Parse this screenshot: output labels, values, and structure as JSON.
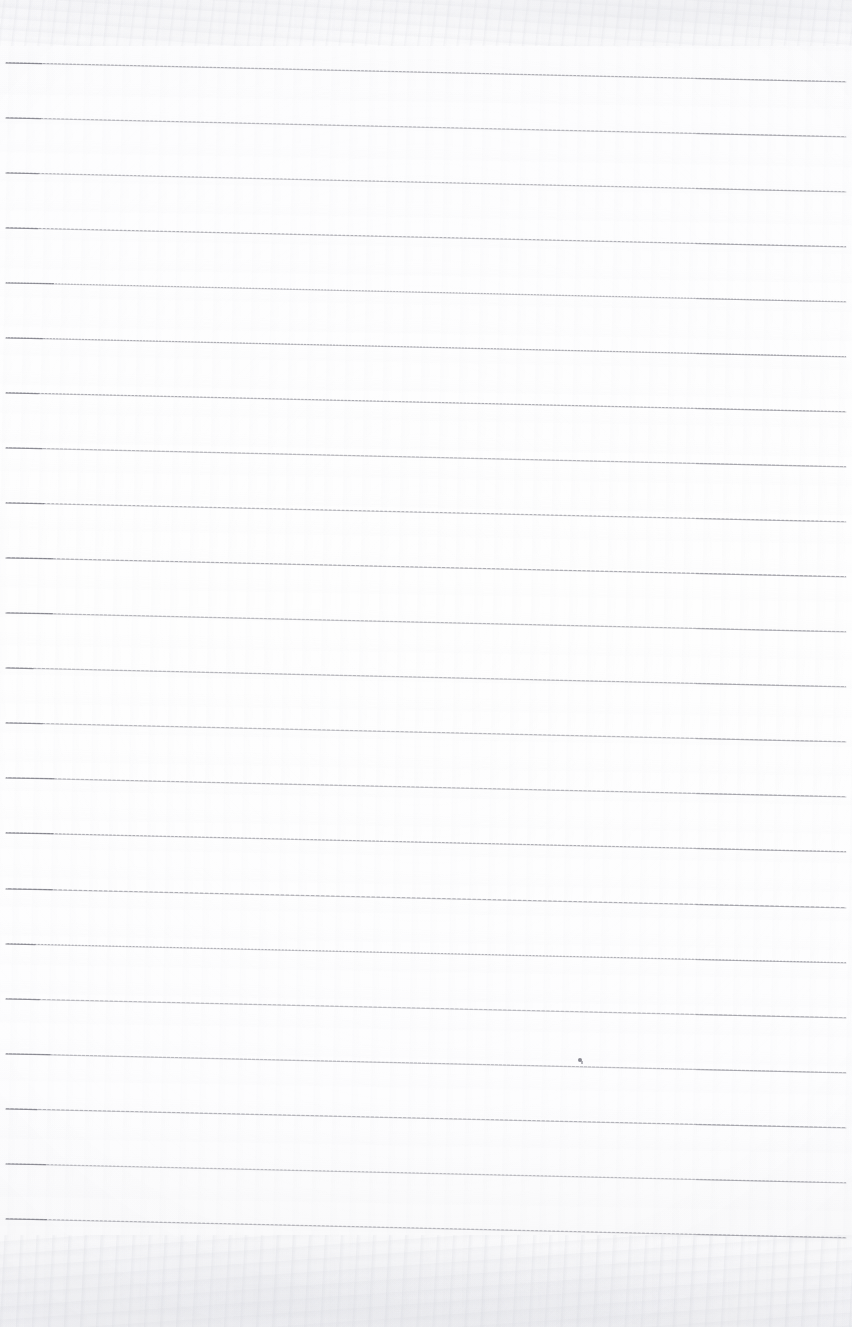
{
  "document": {
    "kind": "scanned-lined-notebook-page",
    "orientation": "portrait",
    "width_px": 852,
    "height_px": 1327,
    "page_background_color": "#fdfdfe",
    "rule_color": "#8a8a93",
    "content_text": "",
    "handwriting_present": "no",
    "printed_text_present": "no"
  },
  "paper": {
    "tone_top": "#f7f7f9",
    "tone_middle": "#fefefe",
    "tone_bottom": "#f3f3f5",
    "grain_top_band_height": 46,
    "grain_bottom_band_height": 92,
    "vignette_edge_color": "#dedee6"
  },
  "ruling": {
    "count": 22,
    "line_color": "#8a8a93",
    "line_thickness_px": 1,
    "spacing_px": 55,
    "first_line_y_left": 63,
    "left_margin_x": 6,
    "right_end_x": 846,
    "skew_drop_px": 19,
    "lines": [
      {
        "index": 1,
        "y_left": 63,
        "y_right": 82
      },
      {
        "index": 2,
        "y_left": 118,
        "y_right": 137
      },
      {
        "index": 3,
        "y_left": 173,
        "y_right": 192
      },
      {
        "index": 4,
        "y_left": 228,
        "y_right": 247
      },
      {
        "index": 5,
        "y_left": 283,
        "y_right": 302
      },
      {
        "index": 6,
        "y_left": 338,
        "y_right": 357
      },
      {
        "index": 7,
        "y_left": 393,
        "y_right": 412
      },
      {
        "index": 8,
        "y_left": 448,
        "y_right": 467
      },
      {
        "index": 9,
        "y_left": 503,
        "y_right": 522
      },
      {
        "index": 10,
        "y_left": 558,
        "y_right": 577
      },
      {
        "index": 11,
        "y_left": 613,
        "y_right": 632
      },
      {
        "index": 12,
        "y_left": 668,
        "y_right": 687
      },
      {
        "index": 13,
        "y_left": 723,
        "y_right": 742
      },
      {
        "index": 14,
        "y_left": 778,
        "y_right": 797
      },
      {
        "index": 15,
        "y_left": 833,
        "y_right": 852
      },
      {
        "index": 16,
        "y_left": 889,
        "y_right": 908
      },
      {
        "index": 17,
        "y_left": 944,
        "y_right": 963
      },
      {
        "index": 18,
        "y_left": 999,
        "y_right": 1018
      },
      {
        "index": 19,
        "y_left": 1054,
        "y_right": 1073
      },
      {
        "index": 20,
        "y_left": 1109,
        "y_right": 1128
      },
      {
        "index": 21,
        "y_left": 1164,
        "y_right": 1183
      },
      {
        "index": 22,
        "y_left": 1219,
        "y_right": 1238
      }
    ]
  },
  "marks": [
    {
      "name": "ink-speck",
      "x": 578,
      "y": 1060,
      "color": "#6e6e78",
      "size_px": 4
    }
  ]
}
